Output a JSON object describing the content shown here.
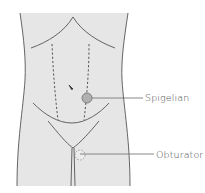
{
  "figure": {
    "type": "anatomical-diagram",
    "colors": {
      "skin_fill": "#e6e6e6",
      "outline": "#555555",
      "spigelian_marker": "#b0b0b0",
      "leader_line": "#6a6a6a",
      "label_text": "#4a4a4a"
    },
    "labels": [
      {
        "id": "spigelian",
        "text": "Spigelian",
        "marker": "solid-circle"
      },
      {
        "id": "obturator",
        "text": "Obturator",
        "marker": "dashed-circle"
      }
    ]
  }
}
